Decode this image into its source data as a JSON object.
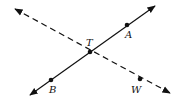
{
  "diagram": {
    "colors": {
      "line": "#111111",
      "background": "#ffffff"
    },
    "lines": [
      {
        "name": "line-BA",
        "style": "solid",
        "from": [
          30,
          95
        ],
        "to": [
          155,
          6
        ],
        "arrows": "both"
      },
      {
        "name": "line-TW",
        "style": "dashed",
        "from": [
          15,
          9
        ],
        "to": [
          170,
          93
        ],
        "arrows": "both"
      }
    ],
    "points": [
      {
        "id": "T",
        "label": "T",
        "x": 90,
        "y": 52,
        "lx": 86,
        "ly": 46
      },
      {
        "id": "A",
        "label": "A",
        "x": 127,
        "y": 25,
        "lx": 125,
        "ly": 38
      },
      {
        "id": "B",
        "label": "B",
        "x": 51,
        "y": 80,
        "lx": 49,
        "ly": 93
      },
      {
        "id": "W",
        "label": "W",
        "x": 140,
        "y": 79,
        "lx": 131,
        "ly": 93
      }
    ]
  }
}
